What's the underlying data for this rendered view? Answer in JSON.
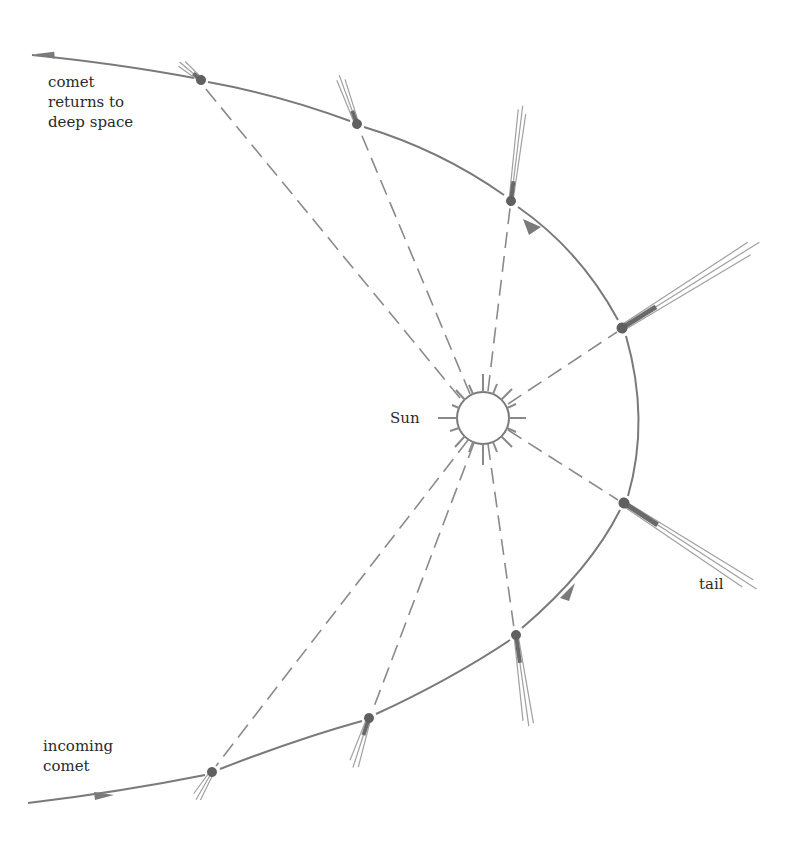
{
  "diagram": {
    "colors": {
      "line": "#7a7a7a",
      "comet": "#6a6a6a",
      "tail": "#9a9a9a",
      "text": "#2a2a2a",
      "background": "#ffffff"
    },
    "labels": {
      "returns": "comet\nreturns to\ndeep space",
      "sun": "Sun",
      "tail": "tail",
      "incoming": "incoming\ncomet"
    },
    "sun": {
      "cx": 483,
      "cy": 418,
      "r": 26
    },
    "comets": [
      {
        "id": 1,
        "x": 212,
        "y": 772,
        "tail_angle_deg": 120,
        "tail_length": 30
      },
      {
        "id": 2,
        "x": 369,
        "y": 718,
        "tail_angle_deg": 110,
        "tail_length": 50
      },
      {
        "id": 3,
        "x": 516,
        "y": 635,
        "tail_angle_deg": 82,
        "tail_length": 90
      },
      {
        "id": 4,
        "x": 624,
        "y": 503,
        "tail_angle_deg": 33,
        "tail_length": 155
      },
      {
        "id": 5,
        "x": 622,
        "y": 328,
        "tail_angle_deg": -33,
        "tail_length": 160
      },
      {
        "id": 6,
        "x": 511,
        "y": 201,
        "tail_angle_deg": -82,
        "tail_length": 95
      },
      {
        "id": 7,
        "x": 357,
        "y": 124,
        "tail_angle_deg": -110,
        "tail_length": 50
      },
      {
        "id": 8,
        "x": 201,
        "y": 80,
        "tail_angle_deg": -140,
        "tail_length": 28
      }
    ]
  }
}
